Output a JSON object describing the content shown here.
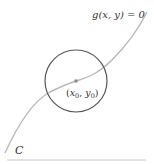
{
  "diagram": {
    "curve_label": "g(x, y) = 0",
    "curve_name": "C",
    "point_label_x": "x",
    "point_label_x_sub": "0",
    "point_label_sep": ", ",
    "point_label_y": "y",
    "point_label_y_sub": "0",
    "colors": {
      "curve": "#b5b5b5",
      "circle": "#555555",
      "point": "#888888",
      "baseline": "#c8c8c8",
      "text": "#333333"
    }
  }
}
